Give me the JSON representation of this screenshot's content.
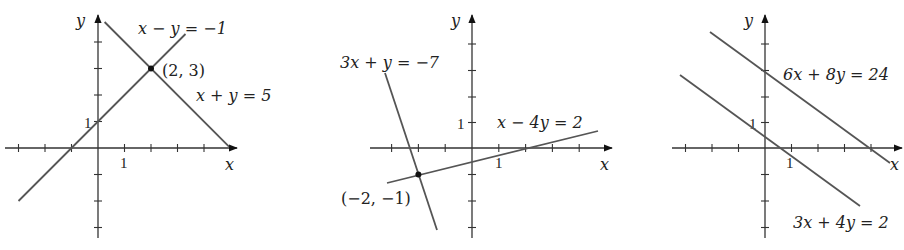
{
  "graphs": [
    {
      "id": "graph-1",
      "origin": [
        98,
        148
      ],
      "unit": 26.5,
      "x_axis": {
        "from": 5,
        "to": 237,
        "label": "x",
        "ticks": [
          -3,
          -2,
          -1,
          1,
          2,
          3,
          4
        ]
      },
      "y_axis": {
        "from": 238,
        "to": 15,
        "label": "y",
        "ticks": [
          -3,
          -2,
          -1,
          1,
          2,
          3,
          4
        ]
      },
      "tick_labels": {
        "x_one": "1",
        "y_one": "1"
      },
      "lines": [
        {
          "equation": "x − y = −1",
          "x1": -3.0,
          "y1": -2.0,
          "x2": 3.3,
          "y2": 4.3
        },
        {
          "equation": "x + y = 5",
          "x1": 0.25,
          "y1": 4.75,
          "x2": 4.95,
          "y2": 0.05
        }
      ],
      "points": [
        {
          "label": "(2, 3)",
          "x": 2,
          "y": 3
        }
      ],
      "labels": {
        "eq1": "x − y = −1",
        "eq2": "x + y = 5",
        "point": "(2, 3)"
      }
    },
    {
      "id": "graph-2",
      "origin": [
        472,
        148
      ],
      "unit": 26.8,
      "x_axis": {
        "from": 370,
        "to": 612,
        "label": "x",
        "ticks": [
          -3,
          -2,
          -1,
          1,
          2,
          3,
          4
        ]
      },
      "y_axis": {
        "from": 238,
        "to": 15,
        "label": "y",
        "ticks": [
          -3,
          -2,
          -1,
          1,
          2,
          3,
          4
        ]
      },
      "tick_labels": {
        "x_one": "1",
        "y_one": "1"
      },
      "lines": [
        {
          "equation": "3x + y = −7",
          "x1": -3.25,
          "y1": 2.75,
          "x2": -1.3,
          "y2": -3.1
        },
        {
          "equation": "x − 4y = 2",
          "x1": -3.2,
          "y1": -1.3,
          "x2": 4.7,
          "y2": 0.62
        }
      ],
      "points": [
        {
          "label": "(−2, −1)",
          "x": -2,
          "y": -1
        }
      ],
      "labels": {
        "eq1": "3x + y = −7",
        "eq2": "x − 4y = 2",
        "point": "(−2, −1)"
      }
    },
    {
      "id": "graph-3",
      "origin": [
        765,
        148
      ],
      "unit": 26.5,
      "x_axis": {
        "from": 672,
        "to": 902,
        "label": "x",
        "ticks": [
          -3,
          -2,
          -1,
          1,
          2,
          3,
          4
        ]
      },
      "y_axis": {
        "from": 238,
        "to": 15,
        "label": "y",
        "ticks": [
          -3,
          -2,
          -1,
          1,
          2,
          3,
          4
        ]
      },
      "tick_labels": {
        "x_one": "1",
        "y_one": "1"
      },
      "lines": [
        {
          "equation": "6x + 8y = 24",
          "x1": -2.07,
          "y1": 4.55,
          "x2": 4.7,
          "y2": -0.55
        },
        {
          "equation": "3x + 4y = 2",
          "x1": -3.2,
          "y1": 2.9,
          "x2": 3.6,
          "y2": -2.2
        }
      ],
      "points": [],
      "labels": {
        "eq1": "6x + 8y = 24",
        "eq2": "3x + 4y = 2"
      }
    }
  ],
  "axis_labels": {
    "x": "x",
    "y": "y"
  },
  "colors": {
    "axis": "#333333",
    "line": "#555555",
    "text": "#222222",
    "background": "#ffffff"
  }
}
